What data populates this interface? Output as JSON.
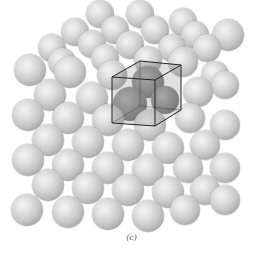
{
  "figure": {
    "caption": "(c)",
    "colors": {
      "sphere_light": "#e2e2e2",
      "sphere_shade": "#9d9d9d",
      "unit_cell_fill": "#8a8a8a",
      "cube_edge": "#222222",
      "background": "#ffffff"
    },
    "unit_cell": {
      "front_face": [
        [
          112,
          77
        ],
        [
          155,
          80
        ],
        [
          155,
          126
        ],
        [
          112,
          123
        ]
      ],
      "back_face": [
        [
          140,
          61
        ],
        [
          181,
          65
        ],
        [
          181,
          110
        ],
        [
          140,
          106
        ]
      ]
    },
    "spheres": [
      {
        "x": 100,
        "y": 14,
        "r": 14
      },
      {
        "x": 140,
        "y": 14,
        "r": 14
      },
      {
        "x": 183,
        "y": 22,
        "r": 14
      },
      {
        "x": 75,
        "y": 32,
        "r": 14
      },
      {
        "x": 115,
        "y": 30,
        "r": 14
      },
      {
        "x": 155,
        "y": 30,
        "r": 14
      },
      {
        "x": 195,
        "y": 35,
        "r": 14
      },
      {
        "x": 228,
        "y": 35,
        "r": 16
      },
      {
        "x": 52,
        "y": 48,
        "r": 14
      },
      {
        "x": 92,
        "y": 44,
        "r": 14
      },
      {
        "x": 130,
        "y": 45,
        "r": 14
      },
      {
        "x": 172,
        "y": 48,
        "r": 14
      },
      {
        "x": 207,
        "y": 48,
        "r": 14
      },
      {
        "x": 62,
        "y": 62,
        "r": 14
      },
      {
        "x": 105,
        "y": 58,
        "r": 14
      },
      {
        "x": 148,
        "y": 60,
        "r": 14
      },
      {
        "x": 215,
        "y": 75,
        "r": 14
      },
      {
        "x": 30,
        "y": 70,
        "r": 16
      },
      {
        "x": 70,
        "y": 72,
        "r": 16
      },
      {
        "x": 112,
        "y": 75,
        "r": 15
      },
      {
        "x": 183,
        "y": 62,
        "r": 15
      },
      {
        "x": 50,
        "y": 95,
        "r": 16
      },
      {
        "x": 92,
        "y": 98,
        "r": 16
      },
      {
        "x": 198,
        "y": 92,
        "r": 15
      },
      {
        "x": 225,
        "y": 85,
        "r": 14
      },
      {
        "x": 28,
        "y": 115,
        "r": 16
      },
      {
        "x": 68,
        "y": 118,
        "r": 16
      },
      {
        "x": 108,
        "y": 120,
        "r": 16
      },
      {
        "x": 150,
        "y": 125,
        "r": 16
      },
      {
        "x": 190,
        "y": 118,
        "r": 15
      },
      {
        "x": 225,
        "y": 125,
        "r": 15
      },
      {
        "x": 48,
        "y": 140,
        "r": 16
      },
      {
        "x": 88,
        "y": 142,
        "r": 16
      },
      {
        "x": 128,
        "y": 145,
        "r": 16
      },
      {
        "x": 168,
        "y": 148,
        "r": 16
      },
      {
        "x": 205,
        "y": 145,
        "r": 15
      },
      {
        "x": 28,
        "y": 160,
        "r": 16
      },
      {
        "x": 68,
        "y": 165,
        "r": 16
      },
      {
        "x": 108,
        "y": 168,
        "r": 16
      },
      {
        "x": 148,
        "y": 170,
        "r": 16
      },
      {
        "x": 188,
        "y": 168,
        "r": 15
      },
      {
        "x": 225,
        "y": 168,
        "r": 15
      },
      {
        "x": 48,
        "y": 185,
        "r": 16
      },
      {
        "x": 88,
        "y": 188,
        "r": 16
      },
      {
        "x": 128,
        "y": 190,
        "r": 16
      },
      {
        "x": 168,
        "y": 192,
        "r": 16
      },
      {
        "x": 205,
        "y": 190,
        "r": 15
      },
      {
        "x": 27,
        "y": 210,
        "r": 16
      },
      {
        "x": 68,
        "y": 212,
        "r": 16
      },
      {
        "x": 108,
        "y": 214,
        "r": 16
      },
      {
        "x": 148,
        "y": 216,
        "r": 16
      },
      {
        "x": 185,
        "y": 210,
        "r": 15
      },
      {
        "x": 225,
        "y": 200,
        "r": 15
      }
    ],
    "dark_spheres": [
      {
        "x": 148,
        "y": 82,
        "r": 16
      },
      {
        "x": 130,
        "y": 104,
        "r": 17
      },
      {
        "x": 165,
        "y": 100,
        "r": 14
      }
    ]
  }
}
